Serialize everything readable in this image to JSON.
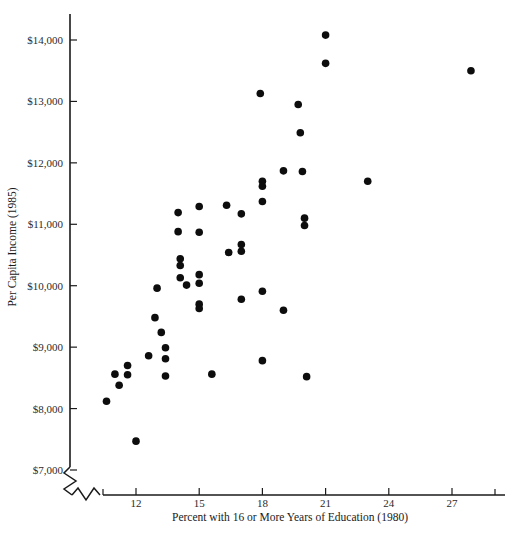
{
  "chart_data": {
    "type": "scatter",
    "title": "",
    "xlabel": "Percent with 16 or More Years of Education (1980)",
    "ylabel": "Per Capita Income (1985)",
    "xlim": [
      10.2,
      28.6
    ],
    "ylim": [
      7000,
      14400
    ],
    "grid": false,
    "legend": null,
    "axis_break_x": true,
    "axis_break_y": true,
    "xticks": [
      12,
      15,
      18,
      21,
      24,
      27
    ],
    "xtick_labels": [
      "12",
      "15",
      "18",
      "21",
      "24",
      "27"
    ],
    "yticks": [
      7000,
      8000,
      9000,
      10000,
      11000,
      12000,
      13000,
      14000
    ],
    "ytick_labels": [
      "$7,000",
      "$8,000",
      "$9,000",
      "$10,000",
      "$11,000",
      "$12,000",
      "$13,000",
      "$14,000"
    ],
    "marker": "filled-circle",
    "marker_color": "#0d0d0d",
    "marker_size": 5,
    "points": [
      {
        "x": 10.6,
        "y": 8120
      },
      {
        "x": 11.0,
        "y": 8560
      },
      {
        "x": 11.2,
        "y": 8380
      },
      {
        "x": 11.6,
        "y": 8700
      },
      {
        "x": 11.6,
        "y": 8550
      },
      {
        "x": 12.0,
        "y": 7470
      },
      {
        "x": 12.6,
        "y": 8860
      },
      {
        "x": 12.9,
        "y": 9480
      },
      {
        "x": 13.0,
        "y": 9960
      },
      {
        "x": 13.2,
        "y": 9240
      },
      {
        "x": 13.4,
        "y": 8990
      },
      {
        "x": 13.4,
        "y": 8810
      },
      {
        "x": 13.4,
        "y": 8530
      },
      {
        "x": 14.0,
        "y": 11190
      },
      {
        "x": 14.0,
        "y": 10880
      },
      {
        "x": 14.1,
        "y": 10440
      },
      {
        "x": 14.1,
        "y": 10330
      },
      {
        "x": 14.1,
        "y": 10130
      },
      {
        "x": 14.4,
        "y": 10010
      },
      {
        "x": 15.0,
        "y": 11290
      },
      {
        "x": 15.0,
        "y": 10870
      },
      {
        "x": 15.0,
        "y": 10180
      },
      {
        "x": 15.0,
        "y": 10040
      },
      {
        "x": 15.0,
        "y": 9700
      },
      {
        "x": 15.0,
        "y": 9630
      },
      {
        "x": 15.6,
        "y": 8560
      },
      {
        "x": 16.3,
        "y": 11310
      },
      {
        "x": 16.4,
        "y": 10540
      },
      {
        "x": 17.0,
        "y": 11170
      },
      {
        "x": 17.0,
        "y": 10670
      },
      {
        "x": 17.0,
        "y": 10560
      },
      {
        "x": 17.0,
        "y": 9780
      },
      {
        "x": 17.9,
        "y": 13130
      },
      {
        "x": 18.0,
        "y": 11700
      },
      {
        "x": 18.0,
        "y": 11620
      },
      {
        "x": 18.0,
        "y": 11370
      },
      {
        "x": 18.0,
        "y": 9910
      },
      {
        "x": 18.0,
        "y": 8780
      },
      {
        "x": 19.0,
        "y": 11870
      },
      {
        "x": 19.0,
        "y": 9600
      },
      {
        "x": 19.7,
        "y": 12950
      },
      {
        "x": 19.8,
        "y": 12490
      },
      {
        "x": 19.9,
        "y": 11860
      },
      {
        "x": 20.0,
        "y": 11100
      },
      {
        "x": 20.0,
        "y": 10980
      },
      {
        "x": 20.1,
        "y": 8520
      },
      {
        "x": 21.0,
        "y": 14080
      },
      {
        "x": 21.0,
        "y": 13620
      },
      {
        "x": 23.0,
        "y": 11700
      },
      {
        "x": 27.9,
        "y": 13500
      }
    ]
  },
  "figure": {
    "background_color": "#ffffff",
    "axis_color": "#1a1a1a"
  }
}
